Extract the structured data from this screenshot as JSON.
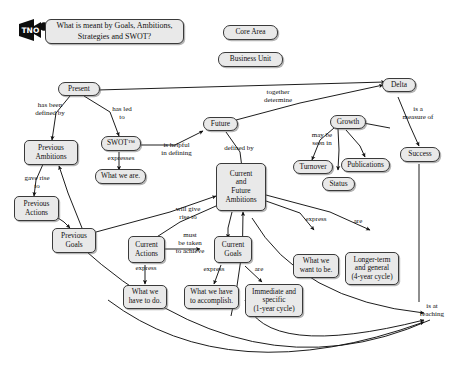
{
  "diagram": {
    "title": "What is meant by Goals, Ambitions, Strategies and SWOT?",
    "logo_alt": "TNO",
    "style": {
      "node_fill": "#e9e9e9",
      "node_stroke": "#3a3a3a",
      "edge_stroke": "#111111",
      "background": "#ffffff"
    }
  },
  "nodes": [
    {
      "id": "title",
      "label": "What is meant by Goals, Ambitions,\nStrategies and SWOT?"
    },
    {
      "id": "core_area",
      "label": "Core Area"
    },
    {
      "id": "business_unit",
      "label": "Business Unit"
    },
    {
      "id": "present",
      "label": "Present"
    },
    {
      "id": "delta",
      "label": "Delta"
    },
    {
      "id": "previous_ambitions",
      "label": "Previous\nAmbitions"
    },
    {
      "id": "swot",
      "label": "SWOT™"
    },
    {
      "id": "future",
      "label": "Future"
    },
    {
      "id": "growth",
      "label": "Growth"
    },
    {
      "id": "success",
      "label": "Success"
    },
    {
      "id": "what_we_are",
      "label": "What we are."
    },
    {
      "id": "turnover",
      "label": "Turnover"
    },
    {
      "id": "publications",
      "label": "Publications"
    },
    {
      "id": "status",
      "label": "Status"
    },
    {
      "id": "current_future_amb",
      "label": "Current\nand\nFuture\nAmbitions"
    },
    {
      "id": "previous_actions",
      "label": "Previous\nActions"
    },
    {
      "id": "previous_goals",
      "label": "Previous\nGoals"
    },
    {
      "id": "current_actions",
      "label": "Current\nActions"
    },
    {
      "id": "current_goals",
      "label": "Current\nGoals"
    },
    {
      "id": "what_we_want_to_be",
      "label": "What we\nwant to be."
    },
    {
      "id": "longer_term",
      "label": "Longer-term\nand general\n(4-year cycle)"
    },
    {
      "id": "what_we_have_to_do",
      "label": "What we\nhave to do."
    },
    {
      "id": "what_we_accomplish",
      "label": "What we have\nto accomplish."
    },
    {
      "id": "immediate_specific",
      "label": "Immediate and\nspecific\n(1-year cycle)"
    }
  ],
  "edge_labels": [
    {
      "id": "has_been_defined_by",
      "text": "has been\ndefined by"
    },
    {
      "id": "has_led_to",
      "text": "has led\nto"
    },
    {
      "id": "together_determine",
      "text": "together\ndetermine"
    },
    {
      "id": "is_a_measure_of",
      "text": "is a\nmeasure of"
    },
    {
      "id": "expresses",
      "text": "expresses"
    },
    {
      "id": "is_helpful_defining",
      "text": "is helpful\nin defining"
    },
    {
      "id": "defined_by",
      "text": "defined by"
    },
    {
      "id": "may_be_seen_in",
      "text": "may be\nseen in"
    },
    {
      "id": "gave_rise_to",
      "text": "gave rise\nto"
    },
    {
      "id": "will_give_rise_to",
      "text": "will give\nrise to"
    },
    {
      "id": "must_be_taken",
      "text": "must\nbe taken\nto achieve"
    },
    {
      "id": "express_left",
      "text": "express"
    },
    {
      "id": "express_mid",
      "text": "express"
    },
    {
      "id": "express_right",
      "text": "express"
    },
    {
      "id": "are_goals",
      "text": "are"
    },
    {
      "id": "are_ambitions",
      "text": "are"
    },
    {
      "id": "is_at_reaching",
      "text": "is at\nreaching"
    }
  ]
}
